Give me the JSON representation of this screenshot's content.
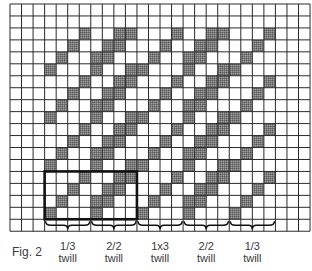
{
  "figure": {
    "caption": "Fig. 2",
    "grid": {
      "cols": 26,
      "rows": 19,
      "left": 10,
      "top": 4,
      "cell_w": 11.54,
      "cell_h": 11.96,
      "line_color": "#2a2a2a",
      "fill_color": "#7a7a7a",
      "filled": {
        "2": [
          6,
          9,
          10,
          14,
          17,
          18,
          22
        ],
        "3": [
          5,
          8,
          9,
          13,
          16,
          17,
          21
        ],
        "4": [
          4,
          7,
          8,
          12,
          15,
          16,
          20
        ],
        "5": [
          3,
          7,
          10,
          11,
          15,
          18,
          19
        ],
        "6": [
          6,
          9,
          10,
          14,
          17,
          18,
          22
        ],
        "7": [
          5,
          8,
          9,
          13,
          16,
          17,
          21
        ],
        "8": [
          4,
          7,
          8,
          12,
          15,
          16,
          20
        ],
        "9": [
          3,
          7,
          10,
          11,
          15,
          18,
          19
        ],
        "10": [
          6,
          9,
          10,
          14,
          17,
          18,
          22
        ],
        "11": [
          5,
          8,
          9,
          13,
          16,
          17,
          21
        ],
        "12": [
          4,
          7,
          8,
          12,
          15,
          16,
          20
        ],
        "13": [
          3,
          7,
          10,
          11,
          15,
          18,
          19
        ],
        "14": [
          6,
          9,
          10,
          14,
          17,
          18,
          22
        ],
        "15": [
          5,
          8,
          9,
          13,
          16,
          17,
          21
        ],
        "16": [
          4,
          7,
          8,
          12,
          15,
          16,
          20
        ],
        "17": [
          3,
          7,
          11,
          15,
          19
        ]
      },
      "highlight_box": {
        "col_start": 3,
        "col_end": 10,
        "row_start": 14,
        "row_end": 17
      }
    },
    "sections": [
      {
        "name": "1/3",
        "sub": "twill",
        "col_start": 3,
        "col_end": 6
      },
      {
        "name": "2/2",
        "sub": "twill",
        "col_start": 7,
        "col_end": 10
      },
      {
        "name": "1x3",
        "sub": "twill",
        "col_start": 11,
        "col_end": 14
      },
      {
        "name": "2/2",
        "sub": "twill",
        "col_start": 15,
        "col_end": 18
      },
      {
        "name": "1/3",
        "sub": "twill",
        "col_start": 19,
        "col_end": 22
      }
    ]
  }
}
